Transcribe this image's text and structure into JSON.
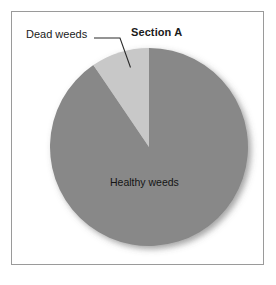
{
  "figure": {
    "title": "Section A",
    "background_color": "#ffffff",
    "frame_color": "#9a9a9a"
  },
  "chart_data": {
    "type": "pie",
    "title": "Section A",
    "xlabel": "",
    "ylabel": "",
    "categories": [
      "Healthy weeds",
      "Dead weeds"
    ],
    "values": [
      90.5,
      9.5
    ],
    "units": "percent",
    "slices": [
      {
        "label": "Healthy weeds",
        "value": 90.5,
        "angle_degrees": 326,
        "color": "#888888",
        "label_placement": "inside"
      },
      {
        "label": "Dead weeds",
        "value": 9.5,
        "angle_degrees": 34,
        "color": "#c8c8c8",
        "label_placement": "outside-leader-line"
      }
    ],
    "start_angle_degrees": 0,
    "direction": "counterclockwise",
    "legend": "none",
    "grid": false,
    "annotations": [
      {
        "text": "Dead weeds",
        "target_slice": "Dead weeds",
        "has_leader_line": true
      },
      {
        "text": "Healthy weeds",
        "target_slice": "Healthy weeds",
        "has_leader_line": false
      }
    ]
  },
  "labels": {
    "dead_weeds": "Dead weeds",
    "healthy_weeds": "Healthy weeds"
  },
  "colors": {
    "slice_healthy": "#888888",
    "slice_dead": "#c8c8c8",
    "leader_line": "#2b2b2b",
    "text": "#1a1a1a"
  }
}
